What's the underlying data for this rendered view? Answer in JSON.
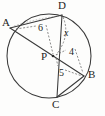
{
  "figure": {
    "stroke_color": "#3a3a3a",
    "dash_color": "#6e6e6e",
    "text_color": "#1d1d1d",
    "background_color": "#fdfdfc",
    "circle": {
      "center_x": 49,
      "center_y": 56,
      "radius": 42
    },
    "points": [
      {
        "name": "A",
        "label": "A",
        "x": 10,
        "y": 28,
        "label_x": 2,
        "label_y": 18
      },
      {
        "name": "D",
        "label": "D",
        "x": 62,
        "y": 15,
        "label_x": 58,
        "label_y": 1
      },
      {
        "name": "B",
        "label": "B",
        "x": 84,
        "y": 76,
        "label_x": 88,
        "label_y": 70
      },
      {
        "name": "C",
        "label": "C",
        "x": 57,
        "y": 97,
        "label_x": 53,
        "label_y": 100
      },
      {
        "name": "P",
        "label": "P",
        "x": 53,
        "y": 56,
        "label_x": 41,
        "label_y": 52
      }
    ],
    "chords": [
      {
        "name": "chord-AB",
        "from": "A",
        "to": "B"
      },
      {
        "name": "chord-DC",
        "from": "D",
        "to": "C"
      },
      {
        "name": "chord-AD",
        "from": "A",
        "to": "D"
      },
      {
        "name": "chord-CB",
        "from": "C",
        "to": "B"
      }
    ],
    "measures": [
      {
        "name": "segment-AP",
        "label": "6",
        "italic": false,
        "x": 39,
        "y": 24,
        "from": "A",
        "to": "P"
      },
      {
        "name": "segment-DP",
        "label": "x",
        "italic": true,
        "x": 63,
        "y": 29,
        "from": "D",
        "to": "P"
      },
      {
        "name": "segment-PB",
        "label": "4",
        "italic": false,
        "x": 69,
        "y": 48,
        "from": "P",
        "to": "B"
      },
      {
        "name": "segment-PC",
        "label": "5",
        "italic": false,
        "x": 59,
        "y": 69,
        "from": "P",
        "to": "C"
      }
    ]
  }
}
